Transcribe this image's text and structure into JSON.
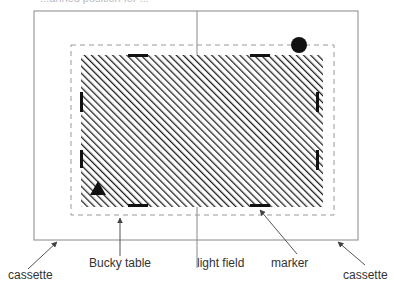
{
  "diagram": {
    "title_cut": "...anned position for ...",
    "labels": {
      "cassette_left": "cassette",
      "bucky_table": "Bucky table",
      "light_field": "light field",
      "marker": "marker",
      "cassette_right": "cassette"
    },
    "colors": {
      "line": "#888888",
      "hatch": "#222222",
      "marker": "#111111",
      "dash": "#999999",
      "text": "#333333"
    }
  }
}
